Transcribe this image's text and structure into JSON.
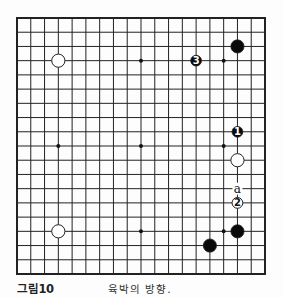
{
  "figure": {
    "label": "그림10",
    "caption": "육박의 방향."
  },
  "board": {
    "size": 19,
    "left": 17,
    "top": 18,
    "right": 265,
    "bottom": 274,
    "line_color": "#222222",
    "background": "#fdfdfd",
    "hoshi": [
      [
        3,
        3
      ],
      [
        9,
        3
      ],
      [
        15,
        3
      ],
      [
        3,
        9
      ],
      [
        9,
        9
      ],
      [
        15,
        9
      ],
      [
        3,
        15
      ],
      [
        9,
        15
      ],
      [
        15,
        15
      ]
    ],
    "stones": [
      {
        "color": "white",
        "col": 3,
        "row": 3,
        "label": ""
      },
      {
        "color": "white",
        "col": 3,
        "row": 15,
        "label": ""
      },
      {
        "color": "black",
        "col": 16,
        "row": 2,
        "label": ""
      },
      {
        "color": "black",
        "col": 13,
        "row": 3,
        "label": "3"
      },
      {
        "color": "black",
        "col": 16,
        "row": 8,
        "label": "1"
      },
      {
        "color": "white",
        "col": 16,
        "row": 10,
        "label": ""
      },
      {
        "color": "white",
        "col": 16,
        "row": 13,
        "label": "2"
      },
      {
        "color": "black",
        "col": 16,
        "row": 15,
        "label": ""
      },
      {
        "color": "black",
        "col": 14,
        "row": 16,
        "label": ""
      }
    ],
    "markers": [
      {
        "col": 16,
        "row": 12,
        "text": "a"
      }
    ]
  }
}
